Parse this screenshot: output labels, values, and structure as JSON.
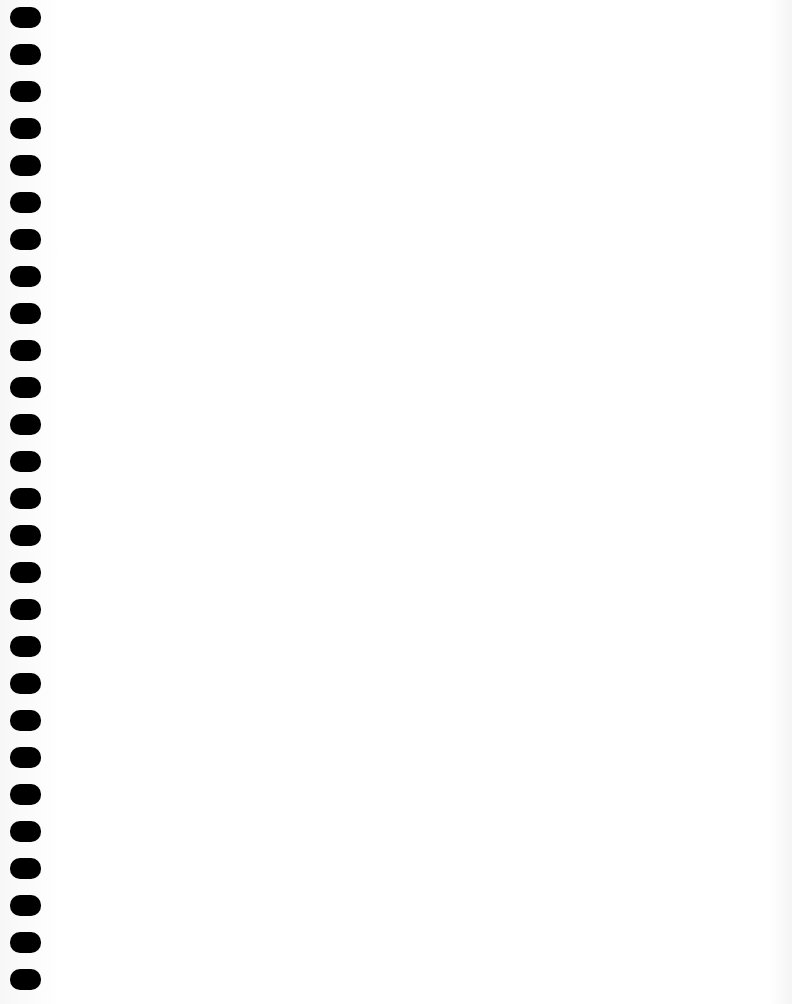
{
  "document": {
    "type": "blank-spiral-bound-page",
    "binding": {
      "side": "left",
      "hole_count": 27,
      "first_hole_top": 7,
      "hole_spacing": 37,
      "hole_color": "#000000"
    },
    "paper_color": "#ffffff",
    "text": ""
  }
}
